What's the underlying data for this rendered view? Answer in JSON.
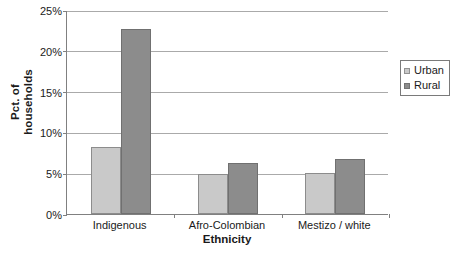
{
  "chart_data": {
    "type": "bar",
    "title": "",
    "xlabel": "Ethnicity",
    "ylabel": "Pct. of households",
    "ylabel_lines": [
      "Pct. of",
      "households"
    ],
    "categories": [
      "Indigenous",
      "Afro-Colombian",
      "Mestizo / white"
    ],
    "series": [
      {
        "name": "Urban",
        "color": "#c9c9c9",
        "values": [
          8.2,
          4.9,
          5.0
        ]
      },
      {
        "name": "Rural",
        "color": "#8c8c8c",
        "values": [
          22.7,
          6.2,
          6.7
        ]
      }
    ],
    "ylim": [
      0,
      25
    ],
    "ytick_values": [
      0,
      5,
      10,
      15,
      20,
      25
    ],
    "ytick_labels": [
      "0%",
      "5%",
      "10%",
      "15%",
      "20%",
      "25%"
    ],
    "grid": "horizontal",
    "legend_position": "right"
  },
  "legend": {
    "entries": [
      {
        "label": "Urban",
        "swatch": "urban-swatch"
      },
      {
        "label": "Rural",
        "swatch": "rural-swatch"
      }
    ]
  },
  "axis": {
    "y_title_line1": "Pct. of",
    "y_title_line2": "households",
    "x_title": "Ethnicity"
  }
}
